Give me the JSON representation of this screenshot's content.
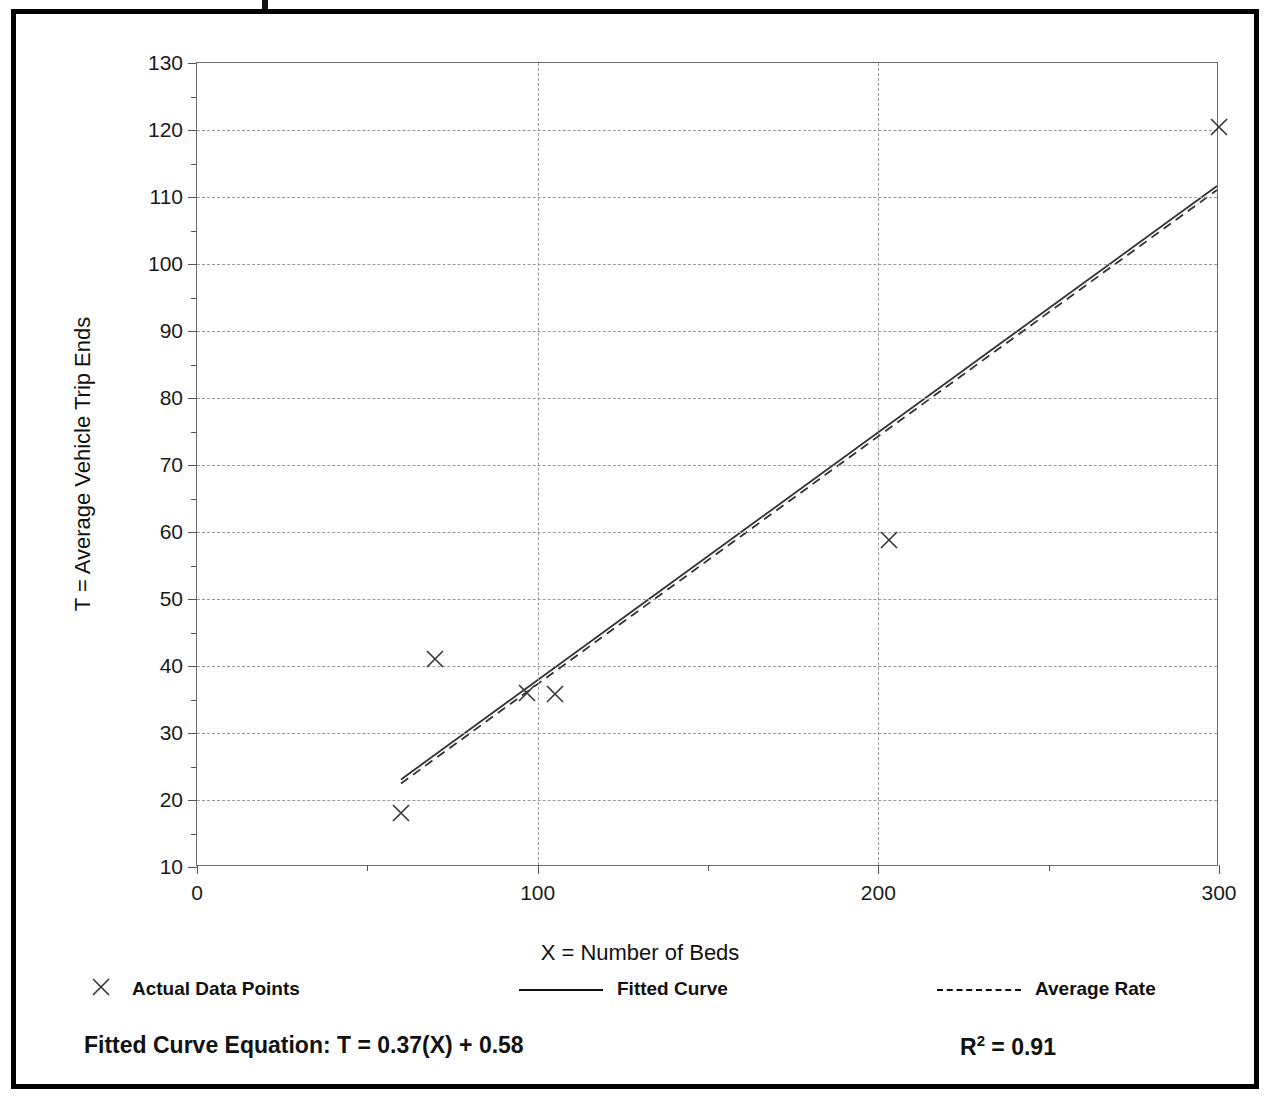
{
  "chart_data": {
    "type": "scatter",
    "title": "",
    "xlabel": "X = Number of Beds",
    "ylabel": "T = Average Vehicle Trip Ends",
    "xlim": [
      0,
      300
    ],
    "ylim": [
      10,
      130
    ],
    "xticks": [
      0,
      100,
      200,
      300
    ],
    "xticklabels": [
      "0",
      "100",
      "200",
      "300"
    ],
    "xminorticks": [
      50,
      150,
      250
    ],
    "yticks": [
      10,
      20,
      30,
      40,
      50,
      60,
      70,
      80,
      90,
      100,
      110,
      120,
      130
    ],
    "yticklabels": [
      "10",
      "20",
      "30",
      "40",
      "50",
      "60",
      "70",
      "80",
      "90",
      "100",
      "110",
      "120",
      "130"
    ],
    "grid": "dotted gridlines on both axes",
    "series": [
      {
        "name": "Actual Data Points",
        "type": "scatter",
        "marker": "x",
        "points": [
          {
            "x": 60,
            "y": 18
          },
          {
            "x": 70,
            "y": 41
          },
          {
            "x": 97,
            "y": 36
          },
          {
            "x": 105,
            "y": 35.8
          },
          {
            "x": 203,
            "y": 58.8
          },
          {
            "x": 300,
            "y": 120.5
          }
        ]
      },
      {
        "name": "Fitted Curve",
        "type": "line",
        "style": "solid",
        "points": [
          {
            "x": 60,
            "y": 22.8
          },
          {
            "x": 300,
            "y": 111.6
          }
        ]
      },
      {
        "name": "Average Rate",
        "type": "line",
        "style": "dashed",
        "points": [
          {
            "x": 60,
            "y": 22.2
          },
          {
            "x": 300,
            "y": 111.0
          }
        ]
      }
    ]
  },
  "axis": {
    "y_title": "T = Average Vehicle Trip Ends",
    "x_title": "X = Number of Beds"
  },
  "legend": {
    "position": "below-plot",
    "items": [
      {
        "label": "Actual Data Points",
        "marker": "x-marker"
      },
      {
        "label": "Fitted Curve",
        "marker": "solid-line"
      },
      {
        "label": "Average Rate",
        "marker": "dashed-line"
      }
    ]
  },
  "footer": {
    "equation": "Fitted Curve Equation:  T = 0.37(X) + 0.58",
    "r_squared_prefix": "R",
    "r_squared_exp": "2",
    "r_squared_value": " = 0.91"
  },
  "colors": {
    "frame": "#000000",
    "grid": "#9b9b9b",
    "axis": "#6d6d6d",
    "ink": "#111111"
  }
}
